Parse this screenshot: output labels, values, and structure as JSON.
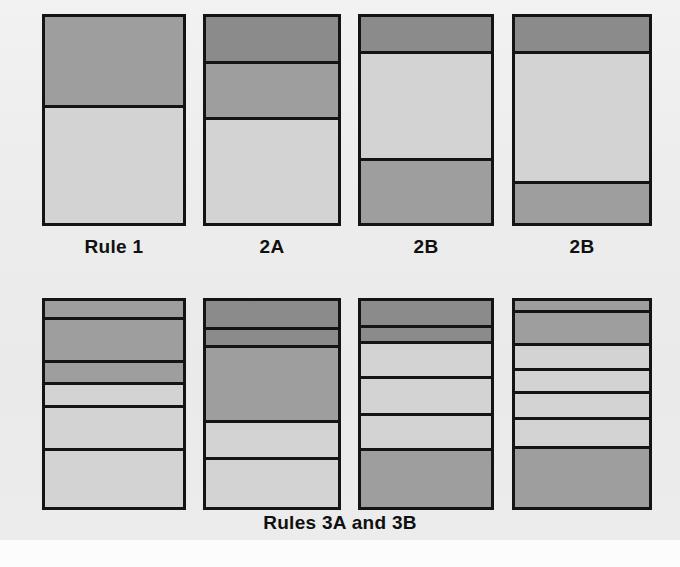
{
  "figure": {
    "background_color": "#eeeeee",
    "bottom_caption": "Rules 3A and 3B"
  },
  "palette": {
    "dark": "#8b8b8b",
    "medium": "#9e9e9e",
    "light": "#d3d3d3",
    "outline": "#141414",
    "paper": "#eeeeee"
  },
  "chart_data": {
    "type": "bar",
    "title": "",
    "subtitle": "",
    "xlabel": "",
    "ylabel": "",
    "orientation": "stacked-vertical",
    "grid": false,
    "legend_position": "none",
    "tones": [
      "dark",
      "medium",
      "light"
    ],
    "columns": [
      {
        "id": "col-1",
        "label": "Rule 1",
        "row": "top",
        "bands": [
          {
            "tone": "medium",
            "pct": 44
          },
          {
            "tone": "light",
            "pct": 56
          }
        ]
      },
      {
        "id": "col-2",
        "label": "2A",
        "row": "top",
        "bands": [
          {
            "tone": "dark",
            "pct": 23
          },
          {
            "tone": "medium",
            "pct": 27
          },
          {
            "tone": "light",
            "pct": 50
          }
        ]
      },
      {
        "id": "col-3",
        "label": "2B",
        "row": "top",
        "bands": [
          {
            "tone": "dark",
            "pct": 18
          },
          {
            "tone": "light",
            "pct": 52
          },
          {
            "tone": "medium",
            "pct": 30
          }
        ]
      },
      {
        "id": "col-4",
        "label": "2B",
        "row": "top",
        "bands": [
          {
            "tone": "dark",
            "pct": 18
          },
          {
            "tone": "light",
            "pct": 63
          },
          {
            "tone": "medium",
            "pct": 19
          }
        ]
      },
      {
        "id": "col-5",
        "label": "",
        "row": "bottom",
        "bands": [
          {
            "tone": "medium",
            "pct": 9
          },
          {
            "tone": "medium",
            "pct": 21
          },
          {
            "tone": "medium",
            "pct": 11
          },
          {
            "tone": "light",
            "pct": 11
          },
          {
            "tone": "light",
            "pct": 21
          },
          {
            "tone": "light",
            "pct": 27
          }
        ]
      },
      {
        "id": "col-6",
        "label": "",
        "row": "bottom",
        "bands": [
          {
            "tone": "dark",
            "pct": 14
          },
          {
            "tone": "dark",
            "pct": 9
          },
          {
            "tone": "medium",
            "pct": 36
          },
          {
            "tone": "light",
            "pct": 18
          },
          {
            "tone": "light",
            "pct": 23
          }
        ]
      },
      {
        "id": "col-7",
        "label": "",
        "row": "bottom",
        "bands": [
          {
            "tone": "dark",
            "pct": 13
          },
          {
            "tone": "dark",
            "pct": 8
          },
          {
            "tone": "light",
            "pct": 17
          },
          {
            "tone": "light",
            "pct": 18
          },
          {
            "tone": "light",
            "pct": 17
          },
          {
            "tone": "medium",
            "pct": 27
          }
        ]
      },
      {
        "id": "col-8",
        "label": "",
        "row": "bottom",
        "bands": [
          {
            "tone": "medium",
            "pct": 6
          },
          {
            "tone": "medium",
            "pct": 16
          },
          {
            "tone": "light",
            "pct": 12
          },
          {
            "tone": "light",
            "pct": 11
          },
          {
            "tone": "light",
            "pct": 13
          },
          {
            "tone": "light",
            "pct": 14
          },
          {
            "tone": "medium",
            "pct": 28
          }
        ]
      }
    ]
  },
  "layout": {
    "top_row": {
      "stack_top": 14,
      "stack_height": 212,
      "label_top": 236,
      "x_positions": [
        42,
        203,
        358,
        512
      ],
      "widths": [
        144,
        138,
        136,
        140
      ]
    },
    "bottom_row": {
      "stack_top": 15,
      "stack_height": 212,
      "x_positions": [
        42,
        203,
        358,
        512
      ],
      "widths": [
        144,
        138,
        136,
        140
      ]
    }
  }
}
